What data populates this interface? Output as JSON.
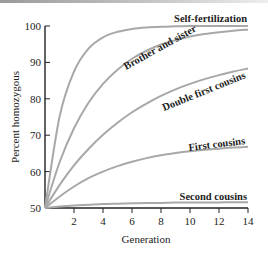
{
  "chart_data": {
    "type": "line",
    "title": "",
    "xlabel": "Generation",
    "ylabel": "Percent homozygous",
    "xlim": [
      0,
      14
    ],
    "ylim": [
      50,
      100
    ],
    "x_ticks": [
      "2",
      "4",
      "6",
      "8",
      "10",
      "12",
      "14"
    ],
    "y_ticks": [
      "50",
      "60",
      "70",
      "80",
      "90",
      "100"
    ],
    "grid": false,
    "legend": "inline labels at right end of curves",
    "x": [
      0,
      1,
      2,
      3,
      4,
      5,
      6,
      7,
      8,
      9,
      10,
      11,
      12,
      13,
      14
    ],
    "series": [
      {
        "name": "Self-fertilization",
        "values": [
          50,
          75,
          87.5,
          93.8,
          96.9,
          98.4,
          99.2,
          99.6,
          99.8,
          99.9,
          100,
          100,
          100,
          100,
          100
        ]
      },
      {
        "name": "Brother and sister",
        "values": [
          50,
          62.5,
          71.9,
          78.9,
          84.1,
          88.0,
          91.0,
          93.2,
          94.9,
          96.1,
          97.1,
          97.8,
          98.3,
          98.7,
          99.0
        ]
      },
      {
        "name": "Double first cousins",
        "values": [
          50,
          56.3,
          61.7,
          66.2,
          70.1,
          73.4,
          76.3,
          78.7,
          80.8,
          82.6,
          84.1,
          85.4,
          86.5,
          87.5,
          88.3
        ]
      },
      {
        "name": "First cousins",
        "values": [
          50,
          53.1,
          55.9,
          58.2,
          60.0,
          61.5,
          62.7,
          63.7,
          64.5,
          65.1,
          65.6,
          66.0,
          66.3,
          66.6,
          66.8
        ]
      },
      {
        "name": "Second cousins",
        "values": [
          50,
          50.4,
          50.7,
          50.9,
          51.1,
          51.2,
          51.3,
          51.4,
          51.4,
          51.5,
          51.5,
          51.5,
          51.5,
          51.6,
          51.6
        ]
      }
    ]
  },
  "labels": {
    "self": "Self-fertilization",
    "brother": "Brother and sister",
    "double": "Double first cousins",
    "first": "First cousins",
    "second": "Second cousins",
    "xlabel": "Generation",
    "ylabel": "Percent homozygous",
    "y100": "100",
    "y90": "90",
    "y80": "80",
    "y70": "70",
    "y60": "60",
    "y50": "50",
    "x2": "2",
    "x4": "4",
    "x6": "6",
    "x8": "8",
    "x10": "10",
    "x12": "12",
    "x14": "14"
  }
}
